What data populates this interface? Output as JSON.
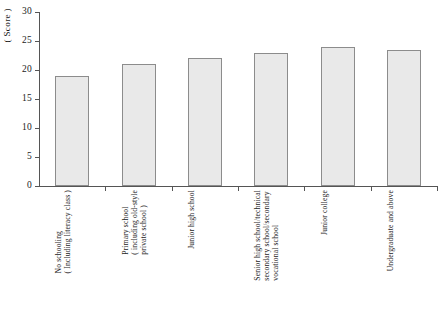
{
  "chart_data": {
    "type": "bar",
    "title": "",
    "subtitle": "",
    "xlabel": "",
    "ylabel": "( Score )",
    "ylim": [
      0,
      30
    ],
    "yticks": [
      0,
      5,
      10,
      15,
      20,
      25,
      30
    ],
    "grid": false,
    "legend": null,
    "categories": [
      "No schooling\n( Including literacy class )",
      "Primary school\n( including old-style\nprivate school )",
      "Junior high school",
      "Senior high school/technical\nsecondary school/secondary\nvocational school",
      "Junior college",
      "Undergraduate and above"
    ],
    "values": [
      19,
      21,
      22,
      23,
      24,
      23.5
    ],
    "bar_color": "#e9e9e9",
    "bar_border_color": "#8c8c8c",
    "axis_color": "#555555"
  },
  "axis": {
    "y_title": "( Score )",
    "tick_labels": [
      "30",
      "25",
      "20",
      "15",
      "10",
      "5",
      "0"
    ]
  },
  "categories": {
    "c0": "No schooling\n( Including literacy class )",
    "c1": "Primary school\n( including old-style\nprivate school )",
    "c2": "Junior high school",
    "c3": "Senior high school/technical\nsecondary school/secondary\nvocational school",
    "c4": "Junior college",
    "c5": "Undergraduate and above"
  }
}
